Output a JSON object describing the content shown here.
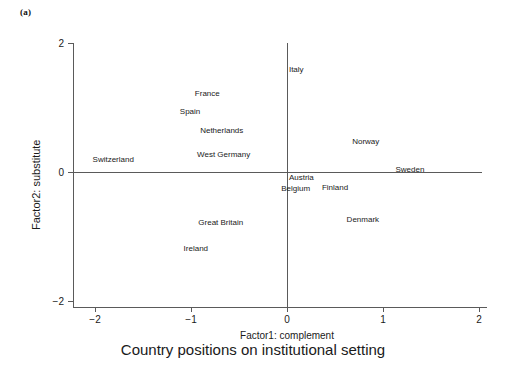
{
  "figure": {
    "panel_label": "(a)",
    "caption": "Country positions on institutional setting"
  },
  "chart_data": {
    "type": "scatter",
    "title": "Country positions on institutional setting",
    "xlabel": "Factor1: complement",
    "ylabel": "Factor2: substitute",
    "xlim": [
      -2,
      2
    ],
    "ylim": [
      -2,
      2
    ],
    "xticks": [
      -2,
      -1,
      0,
      1,
      2
    ],
    "xticklabels": [
      "−2",
      "−1",
      "0",
      "1",
      "2"
    ],
    "yticks": [
      -2,
      0,
      2
    ],
    "yticklabels": [
      "−2",
      "0",
      "2"
    ],
    "grid": false,
    "legend": null,
    "reference_lines": [
      {
        "name": "zero-horizontal",
        "orientation": "horizontal",
        "value": 0
      },
      {
        "name": "zero-vertical",
        "orientation": "vertical",
        "value": 0
      }
    ],
    "labels_only_markers": true,
    "points": [
      {
        "name": "Italy",
        "x": 0.02,
        "y": 1.58,
        "anchor": "start"
      },
      {
        "name": "France",
        "x": -0.83,
        "y": 1.21,
        "anchor": "middle"
      },
      {
        "name": "Spain",
        "x": -1.01,
        "y": 0.93,
        "anchor": "middle"
      },
      {
        "name": "Netherlands",
        "x": -0.68,
        "y": 0.64,
        "anchor": "middle"
      },
      {
        "name": "Norway",
        "x": 0.82,
        "y": 0.47,
        "anchor": "middle"
      },
      {
        "name": "West Germany",
        "x": -0.66,
        "y": 0.26,
        "anchor": "middle"
      },
      {
        "name": "Switzerland",
        "x": -1.81,
        "y": 0.19,
        "anchor": "middle"
      },
      {
        "name": "Sweden",
        "x": 1.28,
        "y": 0.03,
        "anchor": "middle"
      },
      {
        "name": "Austria",
        "x": 0.02,
        "y": -0.09,
        "anchor": "start"
      },
      {
        "name": "Finland",
        "x": 0.5,
        "y": -0.25,
        "anchor": "middle"
      },
      {
        "name": "Belgium",
        "x": 0.09,
        "y": -0.26,
        "anchor": "middle"
      },
      {
        "name": "Denmark",
        "x": 0.79,
        "y": -0.74,
        "anchor": "middle"
      },
      {
        "name": "Great Britain",
        "x": -0.69,
        "y": -0.79,
        "anchor": "middle"
      },
      {
        "name": "Ireland",
        "x": -0.95,
        "y": -1.19,
        "anchor": "middle"
      }
    ]
  }
}
